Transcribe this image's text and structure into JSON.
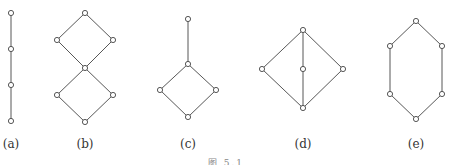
{
  "figure": {
    "caption": "图 5.1",
    "line_color": "#444444",
    "node_fill": "#ffffff",
    "panels": [
      {
        "label": "(a)",
        "lx": 11,
        "nodes": [
          [
            11,
            13
          ],
          [
            11,
            49
          ],
          [
            11,
            85
          ],
          [
            11,
            121
          ]
        ],
        "edges": [
          [
            0,
            1
          ],
          [
            1,
            2
          ],
          [
            2,
            3
          ]
        ]
      },
      {
        "label": "(b)",
        "lx": 85,
        "nodes": [
          [
            85,
            13
          ],
          [
            57,
            40
          ],
          [
            113,
            40
          ],
          [
            85,
            68
          ],
          [
            57,
            95
          ],
          [
            113,
            95
          ],
          [
            85,
            122
          ]
        ],
        "edges": [
          [
            0,
            1
          ],
          [
            0,
            2
          ],
          [
            1,
            3
          ],
          [
            2,
            3
          ],
          [
            3,
            4
          ],
          [
            3,
            5
          ],
          [
            4,
            6
          ],
          [
            5,
            6
          ]
        ]
      },
      {
        "label": "(c)",
        "lx": 188,
        "nodes": [
          [
            188,
            19
          ],
          [
            188,
            64
          ],
          [
            160,
            90
          ],
          [
            216,
            90
          ],
          [
            188,
            117
          ]
        ],
        "edges": [
          [
            0,
            1
          ],
          [
            1,
            2
          ],
          [
            1,
            3
          ],
          [
            2,
            4
          ],
          [
            3,
            4
          ]
        ]
      },
      {
        "label": "(d)",
        "lx": 303,
        "nodes": [
          [
            303,
            30
          ],
          [
            262,
            69
          ],
          [
            303,
            69
          ],
          [
            343,
            69
          ],
          [
            303,
            108
          ]
        ],
        "edges": [
          [
            0,
            1
          ],
          [
            0,
            2
          ],
          [
            0,
            3
          ],
          [
            1,
            4
          ],
          [
            2,
            4
          ],
          [
            3,
            4
          ]
        ]
      },
      {
        "label": "(e)",
        "lx": 416,
        "nodes": [
          [
            416,
            21
          ],
          [
            390,
            46
          ],
          [
            442,
            46
          ],
          [
            390,
            94
          ],
          [
            442,
            94
          ],
          [
            416,
            119
          ]
        ],
        "edges": [
          [
            0,
            1
          ],
          [
            0,
            2
          ],
          [
            1,
            3
          ],
          [
            2,
            4
          ],
          [
            3,
            5
          ],
          [
            4,
            5
          ]
        ]
      }
    ]
  }
}
